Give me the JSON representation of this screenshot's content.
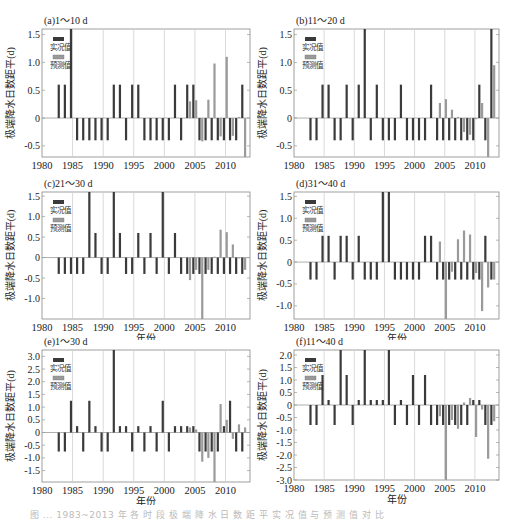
{
  "figure": {
    "caption": "图 ... 1983~2013 年 各 时 段 极 端 降 水 日 数 距 平 实 况 值 与 预 测 值 对 比"
  },
  "legend": {
    "observed": "实况值",
    "predicted": "预测值"
  },
  "colors": {
    "observed": "#3a3a3a",
    "predicted": "#9a9a9a",
    "grid": "#cfcfcf",
    "axis": "#888888"
  },
  "chart_data": [
    {
      "type": "bar",
      "panel_title": "(a)1～10 d",
      "xlabel": "年份",
      "ylabel": "极端降水日数距平(d)",
      "xlim": [
        1980,
        2014
      ],
      "ylim": [
        -0.7,
        1.6
      ],
      "yticks": [
        -0.5,
        0,
        0.5,
        1.0,
        1.5
      ],
      "ytick_labels": [
        "-0.5",
        "0",
        "0.5",
        "1.0",
        "1.5"
      ],
      "xticks": [
        1980,
        1985,
        1990,
        1995,
        2000,
        2005,
        2010
      ],
      "x": [
        1983,
        1984,
        1985,
        1986,
        1987,
        1988,
        1989,
        1990,
        1991,
        1992,
        1993,
        1994,
        1995,
        1996,
        1997,
        1998,
        1999,
        2000,
        2001,
        2002,
        2003,
        2004,
        2005,
        2006,
        2007,
        2008,
        2009,
        2010,
        2011,
        2012,
        2013
      ],
      "series": [
        {
          "name": "实况值",
          "values": [
            0.6,
            0.6,
            1.6,
            -0.4,
            -0.4,
            -0.4,
            -0.4,
            -0.4,
            -0.4,
            0.6,
            0.6,
            -0.4,
            0.6,
            0.6,
            -0.4,
            -0.4,
            -0.4,
            -0.4,
            -0.4,
            0.6,
            -0.4,
            0.6,
            0.6,
            -0.4,
            -0.4,
            -0.4,
            -0.4,
            -0.4,
            -0.4,
            -0.4,
            0.6
          ]
        },
        {
          "name": "预测值",
          "x": [
            2004,
            2005,
            2006,
            2007,
            2008,
            2009,
            2010,
            2011,
            2012,
            2013
          ],
          "values": [
            0.3,
            0.32,
            -0.42,
            0.33,
            0.98,
            -0.33,
            1.1,
            -0.32,
            0.02,
            -0.7
          ]
        }
      ]
    },
    {
      "type": "bar",
      "panel_title": "(b)11～20 d",
      "xlabel": "年份",
      "ylabel": "极端降水日数距平(d)",
      "xlim": [
        1980,
        2014
      ],
      "ylim": [
        -0.7,
        1.6
      ],
      "yticks": [
        -0.5,
        0,
        0.5,
        1.0,
        1.5
      ],
      "ytick_labels": [
        "-0.5",
        "0",
        "0.5",
        "1.0",
        "1.5"
      ],
      "xticks": [
        1980,
        1985,
        1990,
        1995,
        2000,
        2005,
        2010
      ],
      "x": [
        1983,
        1984,
        1985,
        1986,
        1987,
        1988,
        1989,
        1990,
        1991,
        1992,
        1993,
        1994,
        1995,
        1996,
        1997,
        1998,
        1999,
        2000,
        2001,
        2002,
        2003,
        2004,
        2005,
        2006,
        2007,
        2008,
        2009,
        2010,
        2011,
        2012,
        2013
      ],
      "series": [
        {
          "name": "实况值",
          "values": [
            -0.4,
            -0.4,
            0.6,
            0.6,
            -0.4,
            -0.4,
            0.6,
            -0.4,
            0.6,
            1.6,
            -0.4,
            0.6,
            -0.4,
            -0.4,
            -0.4,
            0.6,
            -0.4,
            -0.4,
            -0.4,
            -0.4,
            0.6,
            -0.4,
            -0.4,
            -0.4,
            -0.4,
            -0.4,
            -0.4,
            -0.4,
            0.6,
            -0.4,
            1.6
          ]
        },
        {
          "name": "预测值",
          "x": [
            2004,
            2005,
            2006,
            2007,
            2008,
            2009,
            2010,
            2011,
            2012,
            2013
          ],
          "values": [
            0.27,
            0.34,
            0.15,
            0.02,
            -0.25,
            -0.3,
            -0.02,
            0.27,
            -0.7,
            0.95
          ]
        }
      ]
    },
    {
      "type": "bar",
      "panel_title": "(c)21～30 d",
      "xlabel": "年份",
      "ylabel": "极端降水日数距平(d)",
      "xlim": [
        1980,
        2014
      ],
      "ylim": [
        -1.5,
        1.6
      ],
      "yticks": [
        -1.0,
        -0.5,
        0,
        0.5,
        1.0,
        1.5
      ],
      "ytick_labels": [
        "-1.0",
        "-0.5",
        "0",
        "0.5",
        "1.0",
        "1.5"
      ],
      "xticks": [
        1980,
        1985,
        1990,
        1995,
        2000,
        2005,
        2010
      ],
      "x": [
        1983,
        1984,
        1985,
        1986,
        1987,
        1988,
        1989,
        1990,
        1991,
        1992,
        1993,
        1994,
        1995,
        1996,
        1997,
        1998,
        1999,
        2000,
        2001,
        2002,
        2003,
        2004,
        2005,
        2006,
        2007,
        2008,
        2009,
        2010,
        2011,
        2012,
        2013
      ],
      "series": [
        {
          "name": "实况值",
          "values": [
            -0.4,
            -0.4,
            -0.4,
            -0.4,
            -0.4,
            1.6,
            0.6,
            -0.4,
            -0.4,
            1.6,
            0.6,
            -0.4,
            -0.4,
            0.6,
            -0.4,
            0.6,
            -0.4,
            1.6,
            -0.4,
            0.6,
            -0.4,
            -0.4,
            -0.4,
            -0.4,
            -0.4,
            -0.4,
            -0.4,
            -0.4,
            -0.4,
            -0.4,
            -0.4
          ]
        },
        {
          "name": "预测值",
          "x": [
            2004,
            2005,
            2006,
            2007,
            2008,
            2009,
            2010,
            2011,
            2012,
            2013
          ],
          "values": [
            -0.55,
            -0.3,
            -1.5,
            -0.3,
            0.02,
            0.68,
            0.62,
            0.32,
            -0.02,
            -0.3
          ]
        }
      ]
    },
    {
      "type": "bar",
      "panel_title": "(d)31～40 d",
      "xlabel": "年份",
      "ylabel": "极端降水日数距平(d)",
      "xlim": [
        1980,
        2014
      ],
      "ylim": [
        -1.3,
        1.6
      ],
      "yticks": [
        -1.0,
        -0.5,
        0,
        0.5,
        1.0,
        1.5
      ],
      "ytick_labels": [
        "-1.0",
        "-0.5",
        "0",
        "0.5",
        "1.0",
        "1.5"
      ],
      "xticks": [
        1980,
        1985,
        1990,
        1995,
        2000,
        2005,
        2010
      ],
      "x": [
        1983,
        1984,
        1985,
        1986,
        1987,
        1988,
        1989,
        1990,
        1991,
        1992,
        1993,
        1994,
        1995,
        1996,
        1997,
        1998,
        1999,
        2000,
        2001,
        2002,
        2003,
        2004,
        2005,
        2006,
        2007,
        2008,
        2009,
        2010,
        2011,
        2012,
        2013
      ],
      "series": [
        {
          "name": "实况值",
          "values": [
            -0.4,
            -0.4,
            0.6,
            0.6,
            -0.4,
            0.6,
            0.6,
            -0.4,
            0.6,
            -0.4,
            -0.4,
            -0.4,
            1.6,
            1.6,
            -0.4,
            -0.4,
            -0.4,
            -0.4,
            -0.4,
            0.6,
            0.6,
            -0.4,
            -0.4,
            -0.4,
            -0.4,
            -0.4,
            -0.4,
            -0.4,
            -0.4,
            0.6,
            -0.4
          ]
        },
        {
          "name": "预测值",
          "x": [
            2004,
            2005,
            2006,
            2007,
            2008,
            2009,
            2010,
            2011,
            2012,
            2013
          ],
          "values": [
            0.47,
            -1.3,
            -0.22,
            0.52,
            0.72,
            0.63,
            -0.25,
            -1.12,
            -0.58,
            -0.4
          ]
        }
      ]
    },
    {
      "type": "bar",
      "panel_title": "(e)1～30 d",
      "xlabel": "年份",
      "ylabel": "极端降水日数距平(d)",
      "xlim": [
        1980,
        2014
      ],
      "ylim": [
        -1.95,
        3.25
      ],
      "yticks": [
        -1.5,
        -1.0,
        -0.5,
        0,
        0.5,
        1.0,
        1.5,
        2.0,
        2.5,
        3.0
      ],
      "ytick_labels": [
        "-1.5",
        "-1.0",
        "-0.5",
        "0",
        "0.5",
        "1.0",
        "1.5",
        "2.0",
        "2.5",
        "3.0"
      ],
      "xticks": [
        1980,
        1985,
        1990,
        1995,
        2000,
        2005,
        2010
      ],
      "x": [
        1983,
        1984,
        1985,
        1986,
        1987,
        1988,
        1989,
        1990,
        1991,
        1992,
        1993,
        1994,
        1995,
        1996,
        1997,
        1998,
        1999,
        2000,
        2001,
        2002,
        2003,
        2004,
        2005,
        2006,
        2007,
        2008,
        2009,
        2010,
        2011,
        2012,
        2013
      ],
      "series": [
        {
          "name": "实况值",
          "values": [
            -0.75,
            -0.75,
            1.25,
            0.25,
            -0.75,
            1.25,
            0.25,
            -0.75,
            -0.75,
            3.25,
            0.25,
            0.25,
            -0.75,
            0.25,
            -0.75,
            0.25,
            -0.75,
            1.25,
            -0.75,
            0.25,
            0.25,
            0.25,
            0.25,
            -0.75,
            -0.75,
            -0.75,
            -0.75,
            0.25,
            1.25,
            -0.75,
            -0.75
          ]
        },
        {
          "name": "预测值",
          "x": [
            2004,
            2005,
            2006,
            2007,
            2008,
            2009,
            2010,
            2011,
            2012,
            2013
          ],
          "values": [
            0.2,
            0.12,
            -1.15,
            -1.0,
            -1.95,
            1.12,
            0.5,
            -0.25,
            0.32,
            0.2
          ]
        }
      ]
    },
    {
      "type": "bar",
      "panel_title": "(f)11～40 d",
      "xlabel": "年份",
      "ylabel": "极端降水日数距平(d)",
      "xlim": [
        1980,
        2014
      ],
      "ylim": [
        -3.0,
        2.2
      ],
      "yticks": [
        -3.0,
        -2.5,
        -2.0,
        -1.5,
        -1.0,
        -0.5,
        0,
        0.5,
        1.0,
        1.5,
        2.0
      ],
      "ytick_labels": [
        "-3.0",
        "-2.5",
        "-2.0",
        "-1.5",
        "-1.0",
        "-0.5",
        "0",
        "0.5",
        "1.0",
        "1.5",
        "2.0"
      ],
      "xticks": [
        1980,
        1985,
        1990,
        1995,
        2000,
        2005,
        2010
      ],
      "x": [
        1983,
        1984,
        1985,
        1986,
        1987,
        1988,
        1989,
        1990,
        1991,
        1992,
        1993,
        1994,
        1995,
        1996,
        1997,
        1998,
        1999,
        2000,
        2001,
        2002,
        2003,
        2004,
        2005,
        2006,
        2007,
        2008,
        2009,
        2010,
        2011,
        2012,
        2013
      ],
      "series": [
        {
          "name": "实况值",
          "values": [
            -0.8,
            -0.8,
            1.2,
            0.2,
            -0.8,
            2.2,
            1.2,
            -0.8,
            0.2,
            2.2,
            0.2,
            0.2,
            0.2,
            2.2,
            -0.8,
            0.2,
            -0.8,
            1.2,
            -0.8,
            1.2,
            -0.8,
            -0.8,
            -0.8,
            -0.8,
            -0.8,
            -0.8,
            -0.8,
            0.2,
            0.2,
            -0.8,
            -0.8
          ]
        },
        {
          "name": "预测值",
          "x": [
            2004,
            2005,
            2006,
            2007,
            2008,
            2009,
            2010,
            2011,
            2012,
            2013
          ],
          "values": [
            -0.45,
            -3.0,
            -0.6,
            -0.95,
            0.1,
            0.28,
            -1.28,
            -0.18,
            -2.15,
            -0.65
          ]
        }
      ]
    }
  ]
}
